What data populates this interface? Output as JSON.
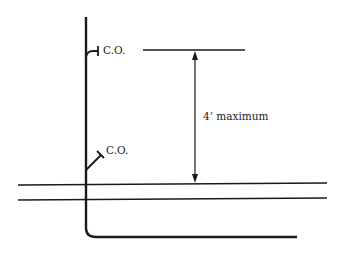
{
  "diagram": {
    "labels": {
      "cleanout_upper": "C.O.",
      "cleanout_lower": "C.O.",
      "dimension": "4’ maximum"
    },
    "colors": {
      "line": "#1a1a1a",
      "background": "#ffffff"
    }
  }
}
